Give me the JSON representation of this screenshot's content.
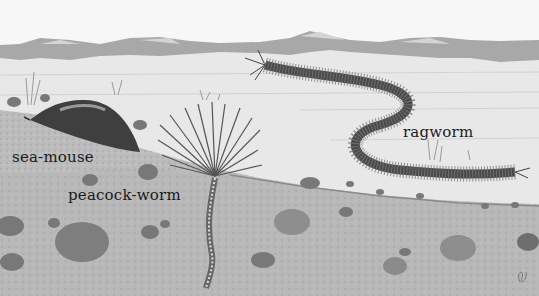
{
  "scene": {
    "description": "Illustration of seabed cross-section with marine worms",
    "colors": {
      "sky": "#f7f7f7",
      "water_surface": "#a9a9a9",
      "water": "#e6e6e6",
      "seabed": "#bdbdbd",
      "deep_sediment": "#b4b4b4",
      "stones": "#7a7a7a",
      "worm": "#4a4a4a",
      "label_text": "#1a1a1a"
    }
  },
  "labels": [
    {
      "id": "sea-mouse",
      "text": "sea-mouse",
      "x": 12,
      "y": 150
    },
    {
      "id": "peacock-worm",
      "text": "peacock-worm",
      "x": 68,
      "y": 188
    },
    {
      "id": "ragworm",
      "text": "ragworm",
      "x": 403,
      "y": 125
    }
  ]
}
